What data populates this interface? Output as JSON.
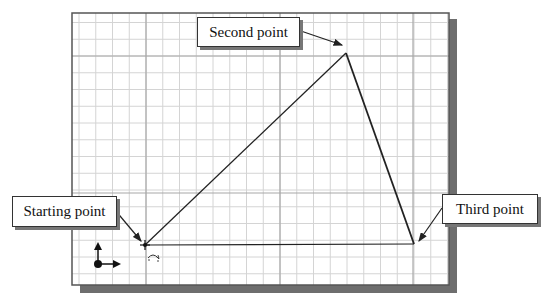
{
  "canvas": {
    "bounds": {
      "left": 72,
      "top": 13,
      "right": 449,
      "bottom": 285
    },
    "minor_grid_spacing": 16.75,
    "major_lines_x": [
      146,
      280,
      413
    ],
    "major_lines_y": [
      56,
      193
    ],
    "colors": {
      "background": "#ffffff",
      "minor_grid": "#d4d4d4",
      "major_grid": "#a8a8a8",
      "border": "#555555",
      "shadow": "#6e6e6e",
      "line": "#222222"
    }
  },
  "points": {
    "start": {
      "x": 145,
      "y": 245
    },
    "second": {
      "x": 346,
      "y": 53
    },
    "third": {
      "x": 414,
      "y": 244
    }
  },
  "callouts": {
    "second": {
      "label": "Second point",
      "box": {
        "x": 197,
        "y": 17,
        "w": 101,
        "h": 28
      },
      "arrow_from": {
        "x": 298,
        "y": 30
      },
      "arrow_to": {
        "x": 342,
        "y": 45
      }
    },
    "start": {
      "label": "Starting point",
      "box": {
        "x": 12,
        "y": 196,
        "w": 103,
        "h": 29
      },
      "arrow_from": {
        "x": 115,
        "y": 210
      },
      "arrow_to": {
        "x": 141,
        "y": 241
      }
    },
    "third": {
      "label": "Third point",
      "box": {
        "x": 442,
        "y": 194,
        "w": 94,
        "h": 28
      },
      "arrow_from": {
        "x": 442,
        "y": 208
      },
      "arrow_to": {
        "x": 419,
        "y": 241
      }
    }
  },
  "icons": {
    "ucs": "coordinate-axes-icon",
    "cursor_hint": "rotate-arc-icon"
  }
}
